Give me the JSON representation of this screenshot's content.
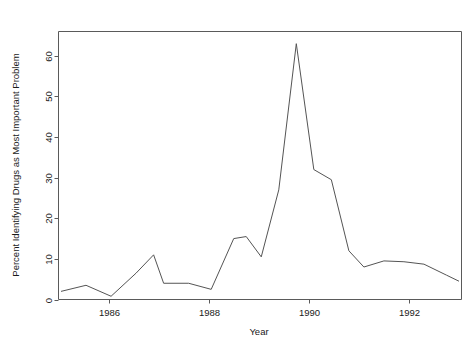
{
  "chart_data": {
    "type": "line",
    "title": "",
    "xlabel": "Year",
    "ylabel": "Percent Identifying Drugs as Most Important Problem",
    "xlim": [
      1985.0,
      1993.05
    ],
    "ylim": [
      0,
      66
    ],
    "grid": false,
    "legend": null,
    "xticks": [
      1986,
      1988,
      1990,
      1992
    ],
    "xtick_labels": [
      "1986",
      "1988",
      "1990",
      "1992"
    ],
    "yticks": [
      0,
      10,
      20,
      30,
      40,
      50,
      60
    ],
    "ytick_labels": [
      "0",
      "10",
      "20",
      "30",
      "40",
      "50",
      "60"
    ],
    "series": [
      {
        "name": "Percent Identifying Drugs as Most Important Problem",
        "color": "#545454",
        "x": [
          1985.05,
          1985.55,
          1986.05,
          1986.55,
          1986.9,
          1987.1,
          1987.6,
          1988.05,
          1988.5,
          1988.75,
          1989.05,
          1989.4,
          1989.75,
          1990.1,
          1990.45,
          1990.8,
          1991.1,
          1991.5,
          1991.9,
          1992.3,
          1992.75,
          1993.0
        ],
        "y": [
          2.0,
          3.5,
          0.8,
          6.5,
          11.0,
          4.0,
          4.0,
          2.5,
          15.0,
          15.5,
          10.5,
          27.0,
          63.0,
          32.0,
          29.5,
          12.0,
          8.0,
          9.5,
          9.3,
          8.7,
          6.0,
          4.5
        ]
      }
    ]
  },
  "axes": {
    "x_tick_color": "#5a5a5a",
    "y_tick_color": "#5a5a5a",
    "frame_color": "#5a5a5a"
  }
}
